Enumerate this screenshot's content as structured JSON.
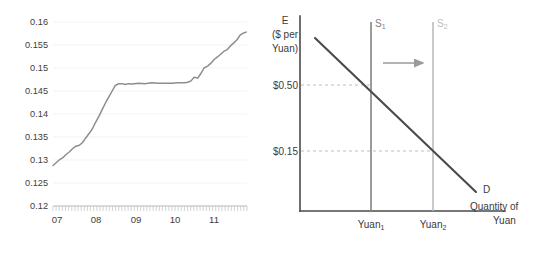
{
  "figure": {
    "background_color": "#ffffff"
  },
  "chart_data": [
    {
      "id": "left-timeseries",
      "type": "line",
      "title": "",
      "xlabel": "",
      "ylabel": "",
      "ylim": [
        0.12,
        0.16
      ],
      "xlim": [
        2007.0,
        2011.92
      ],
      "grid": true,
      "legend": null,
      "y_ticks": [
        "0.12",
        "0.125",
        "0.13",
        "0.135",
        "0.14",
        "0.145",
        "0.15",
        "0.155",
        "0.16"
      ],
      "y_tick_values": [
        0.12,
        0.125,
        0.13,
        0.135,
        0.14,
        0.145,
        0.15,
        0.155,
        0.16
      ],
      "x_ticks": [
        "07",
        "08",
        "09",
        "10",
        "11"
      ],
      "x_tick_values": [
        2007,
        2008,
        2009,
        2010,
        2011
      ],
      "series": [
        {
          "name": "Dollars per Yuan",
          "color": "#8d8d8d",
          "x": [
            2007.0,
            2007.08,
            2007.17,
            2007.25,
            2007.33,
            2007.42,
            2007.5,
            2007.58,
            2007.67,
            2007.75,
            2007.83,
            2007.92,
            2008.0,
            2008.08,
            2008.17,
            2008.25,
            2008.33,
            2008.42,
            2008.5,
            2008.58,
            2008.67,
            2008.75,
            2008.83,
            2008.92,
            2009.0,
            2009.17,
            2009.33,
            2009.5,
            2009.67,
            2009.83,
            2010.0,
            2010.17,
            2010.33,
            2010.42,
            2010.5,
            2010.58,
            2010.67,
            2010.75,
            2010.83,
            2010.92,
            2011.0,
            2011.08,
            2011.17,
            2011.25,
            2011.33,
            2011.42,
            2011.5,
            2011.58,
            2011.67,
            2011.75,
            2011.83,
            2011.9
          ],
          "y": [
            0.1288,
            0.1294,
            0.1301,
            0.1305,
            0.1312,
            0.1318,
            0.1325,
            0.133,
            0.1332,
            0.1338,
            0.1348,
            0.1358,
            0.1368,
            0.1382,
            0.1396,
            0.141,
            0.1424,
            0.1438,
            0.145,
            0.1462,
            0.1466,
            0.1466,
            0.1464,
            0.1466,
            0.1465,
            0.1467,
            0.1466,
            0.1468,
            0.1467,
            0.1467,
            0.1467,
            0.1468,
            0.1468,
            0.1469,
            0.1472,
            0.148,
            0.1478,
            0.1488,
            0.15,
            0.1504,
            0.151,
            0.1518,
            0.1524,
            0.153,
            0.1536,
            0.154,
            0.1548,
            0.1554,
            0.1562,
            0.1572,
            0.1576,
            0.1578
          ]
        }
      ]
    },
    {
      "id": "right-supply-demand",
      "type": "line",
      "title": "",
      "xlabel": "Quantity of Yuan",
      "ylabel": "E ($ per Yuan)",
      "grid": false,
      "legend": null,
      "annotations": [
        {
          "name": "supply-1-label",
          "text": "S",
          "subscript": "1",
          "color": "#7e7e7e"
        },
        {
          "name": "supply-2-label",
          "text": "S",
          "subscript": "2",
          "color": "#bdbdbd"
        },
        {
          "name": "demand-label",
          "text": "D",
          "color": "#3b3b3b"
        },
        {
          "name": "shift-arrow",
          "text": "",
          "direction": "right",
          "color": "#9a9a9a"
        }
      ],
      "y_ticks": [
        "$0.50",
        "$0.15"
      ],
      "y_tick_values": [
        0.5,
        0.15
      ],
      "x_ticks": [
        "Yuan₁",
        "Yuan₂"
      ],
      "series": [
        {
          "name": "Demand",
          "label": "D",
          "type": "downward-sloping-line",
          "color": "#4a4a4a"
        },
        {
          "name": "Supply 1",
          "label": "S1",
          "type": "vertical-line",
          "color": "#8a8a8a"
        },
        {
          "name": "Supply 2",
          "label": "S2",
          "type": "vertical-line",
          "color": "#b9b9b9"
        }
      ],
      "equilibria": [
        {
          "quantity_label": "Yuan₁",
          "price_label": "$0.50"
        },
        {
          "quantity_label": "Yuan₂",
          "price_label": "$0.15"
        }
      ]
    }
  ],
  "left_chart": {
    "y_axis": {
      "name": "dollars-per-yuan-axis",
      "ticks": [
        "0.16",
        "0.155",
        "0.15",
        "0.145",
        "0.14",
        "0.135",
        "0.13",
        "0.125",
        "0.12"
      ]
    },
    "x_axis": {
      "name": "year-axis",
      "ticks": [
        "07",
        "08",
        "09",
        "10",
        "11"
      ]
    }
  },
  "right_chart": {
    "y_axis_title_line1": "E",
    "y_axis_title_line2": "($ per",
    "y_axis_title_line3": "Yuan)",
    "price_high": "$0.50",
    "price_low": "$0.15",
    "quantity_1": "Yuan",
    "quantity_1_sub": "1",
    "quantity_2": "Yuan",
    "quantity_2_sub": "2",
    "supply_1": "S",
    "supply_1_sub": "1",
    "supply_2": "S",
    "supply_2_sub": "2",
    "demand": "D",
    "x_axis_title_line1": "Quantity of",
    "x_axis_title_line2": "Yuan"
  }
}
